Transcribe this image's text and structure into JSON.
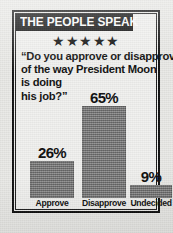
{
  "banner": {
    "title": "THE PEOPLE SPEAK"
  },
  "rating": {
    "stars": "★★★★★",
    "count": 5
  },
  "quote": {
    "line1": "“Do you approve or disapprove",
    "line2": "of the way President Moon",
    "line3": "is doing",
    "line4": "his job?”"
  },
  "chart_data": {
    "type": "bar",
    "title": "THE PEOPLE SPEAK",
    "annotation": "“Do you approve or disapprove of the way President Moon is doing his job?”",
    "categories": [
      "Approve",
      "Disapprove",
      "Undecided"
    ],
    "values": [
      26,
      65,
      9
    ],
    "value_labels": [
      "26%",
      "65%",
      "9%"
    ],
    "xlabel": "",
    "ylabel": "",
    "ylim": [
      0,
      100
    ],
    "grid": false,
    "legend": "none",
    "bar_color": "#7b7b7b"
  },
  "colors": {
    "frame": "#111111",
    "banner_bg": "#0d0d0d",
    "banner_text": "#fdfdfd",
    "panel_bg": "#f1f1ef",
    "paper_bg": "#e9e9e6",
    "bar": "#7b7b7b",
    "text": "#101010"
  }
}
